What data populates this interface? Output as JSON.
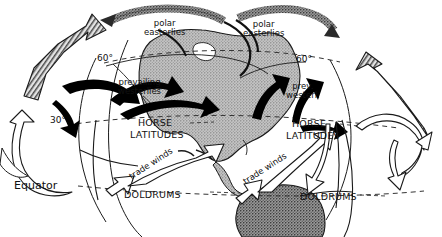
{
  "figure": {
    "type": "diagram",
    "style": "black and white line drawing, halftone stippled landmass"
  },
  "labels": {
    "polar_easterlies_left": "polar\neasterlies",
    "polar_easterlies_left_l1": "polar",
    "polar_easterlies_left_l2": "easterlies",
    "polar_easterlies_right_l1": "polar",
    "polar_easterlies_right_l2": "easterlies",
    "prevailing_westerlies_l1": "prevailing",
    "prevailing_westerlies_l2": "westerlies",
    "prev_westerlies_right_l1": "prev.",
    "prev_westerlies_right_l2": "westerl.",
    "lat_60_left": "60°",
    "lat_60_right": "60°",
    "lat_30_left": "30°",
    "horse_left_l1": "HORSE",
    "horse_left_l2": "LATITUDES",
    "horse_right_l1": "HORSE",
    "horse_right_l2": "LATITUDES",
    "trade_winds_left": "trade winds",
    "trade_winds_right": "trade winds",
    "doldrums_left": "DOLDRUMS",
    "doldrums_right": "DOLDRUMS",
    "equator": "Equator"
  },
  "colors": {
    "ink": "#111111",
    "paper": "#ffffff",
    "land_fill": "#b9b9b9",
    "land_stroke": "#1a1a1a",
    "dash": "#333333",
    "solid_arrow": "#000000",
    "hatch_arrow": "#555555"
  },
  "wind_belts": [
    {
      "name": "polar easterlies",
      "hemisphere": "north",
      "latitude_band": "60-90",
      "arrow_style": "stippled-curved"
    },
    {
      "name": "prevailing westerlies",
      "hemisphere": "north",
      "latitude_band": "30-60",
      "arrow_style": "solid-black"
    },
    {
      "name": "trade winds",
      "hemisphere": "north",
      "latitude_band": "0-30",
      "arrow_style": "outline-white"
    }
  ],
  "latitude_lines": [
    {
      "label": "60°",
      "style": "dashed"
    },
    {
      "label": "30°",
      "style": "dashed"
    },
    {
      "label": "Equator",
      "style": "dashed"
    }
  ],
  "pressure_zones": [
    {
      "label": "HORSE LATITUDES",
      "description": "subtropical high, calm belt near 30°"
    },
    {
      "label": "DOLDRUMS",
      "description": "equatorial low, calm belt near 0°"
    }
  ]
}
